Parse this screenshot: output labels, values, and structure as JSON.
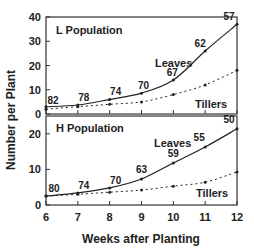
{
  "chart_data": [
    {
      "type": "line",
      "title": "L Population",
      "xlabel": "Weeks after Planting",
      "ylabel": "Number per Plant",
      "x": [
        6,
        7,
        8,
        9,
        10,
        11,
        12
      ],
      "ylim": [
        0,
        40
      ],
      "yticks": [
        0,
        10,
        20,
        30,
        40
      ],
      "series": [
        {
          "name": "Leaves",
          "style": "solid",
          "values": [
            3,
            3.7,
            6,
            8.6,
            14,
            26,
            37
          ]
        },
        {
          "name": "Tillers",
          "style": "dotted",
          "values": [
            2,
            3,
            4,
            5,
            8,
            12,
            18
          ]
        }
      ],
      "annotations": [
        "82",
        "78",
        "74",
        "70",
        "67",
        "62",
        "57"
      ]
    },
    {
      "type": "line",
      "title": "H Population",
      "xlabel": "Weeks after Planting",
      "ylabel": "Number per Plant",
      "x": [
        6,
        7,
        8,
        9,
        10,
        11,
        12
      ],
      "ylim": [
        0,
        25
      ],
      "yticks": [
        0,
        10,
        20
      ],
      "series": [
        {
          "name": "Leaves",
          "style": "solid",
          "values": [
            2.5,
            3.4,
            4.8,
            7.3,
            11.8,
            16.3,
            21.4
          ]
        },
        {
          "name": "Tillers",
          "style": "dotted",
          "values": [
            2.5,
            3,
            3.6,
            4.2,
            5.3,
            6.4,
            9.3
          ]
        }
      ],
      "annotations": [
        "80",
        "74",
        "70",
        "63",
        "59",
        "55",
        "50"
      ]
    }
  ],
  "labels": {
    "ylabel": "Number per Plant",
    "xlabel": "Weeks after Planting",
    "top_title": "L Population",
    "bottom_title": "H Population",
    "leaves": "Leaves",
    "tillers": "Tillers",
    "xticks": [
      "6",
      "7",
      "8",
      "9",
      "10",
      "11",
      "12"
    ],
    "top_yticks": [
      "0",
      "10",
      "20",
      "30",
      "40"
    ],
    "bottom_yticks": [
      "0",
      "10",
      "20"
    ]
  }
}
